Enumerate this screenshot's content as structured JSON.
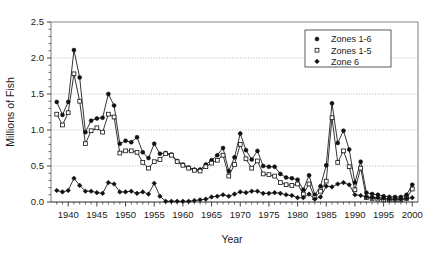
{
  "chart_data": {
    "type": "line",
    "title": "",
    "xlabel": "Year",
    "ylabel": "Millions of Fish",
    "xlim": [
      1937,
      2001
    ],
    "ylim": [
      0.0,
      2.5
    ],
    "grid": true,
    "legend_position": "top-right",
    "y_ticks": [
      "0.0",
      "0.5",
      "1.0",
      "1.5",
      "2.0",
      "2.5"
    ],
    "y_tick_values": [
      0.0,
      0.5,
      1.0,
      1.5,
      2.0,
      2.5
    ],
    "x_ticks": [
      "1940",
      "1945",
      "1950",
      "1955",
      "1960",
      "1965",
      "1970",
      "1975",
      "1980",
      "1985",
      "1990",
      "1995",
      "2000"
    ],
    "x_tick_values": [
      1940,
      1945,
      1950,
      1955,
      1960,
      1965,
      1970,
      1975,
      1980,
      1985,
      1990,
      1995,
      2000
    ],
    "x": [
      1938,
      1939,
      1940,
      1941,
      1942,
      1943,
      1944,
      1945,
      1946,
      1947,
      1948,
      1949,
      1950,
      1951,
      1952,
      1953,
      1954,
      1955,
      1956,
      1957,
      1958,
      1959,
      1960,
      1961,
      1962,
      1963,
      1964,
      1965,
      1966,
      1967,
      1968,
      1969,
      1970,
      1971,
      1972,
      1973,
      1974,
      1975,
      1976,
      1977,
      1978,
      1979,
      1980,
      1981,
      1982,
      1983,
      1984,
      1985,
      1986,
      1987,
      1988,
      1989,
      1990,
      1991,
      1992,
      1993,
      1994,
      1995,
      1996,
      1997,
      1998,
      1999,
      2000
    ],
    "series": [
      {
        "name": "Zones 1-6",
        "marker": "filled-circle",
        "values": [
          1.39,
          1.21,
          1.39,
          2.11,
          1.73,
          0.97,
          1.13,
          1.16,
          1.17,
          1.5,
          1.34,
          0.81,
          0.85,
          0.83,
          0.9,
          0.69,
          0.61,
          0.81,
          0.67,
          0.68,
          0.66,
          0.57,
          0.52,
          0.48,
          0.45,
          0.45,
          0.52,
          0.58,
          0.65,
          0.75,
          0.43,
          0.62,
          0.95,
          0.72,
          0.59,
          0.71,
          0.5,
          0.49,
          0.49,
          0.39,
          0.34,
          0.33,
          0.31,
          0.17,
          0.37,
          0.1,
          0.22,
          0.51,
          1.37,
          0.82,
          0.99,
          0.73,
          0.27,
          0.56,
          0.13,
          0.11,
          0.1,
          0.08,
          0.07,
          0.07,
          0.07,
          0.1,
          0.24
        ]
      },
      {
        "name": "Zones 1-5",
        "marker": "open-square",
        "values": [
          1.22,
          1.07,
          1.24,
          1.78,
          1.4,
          0.81,
          0.99,
          1.03,
          0.97,
          1.22,
          1.18,
          0.68,
          0.71,
          0.71,
          0.69,
          0.55,
          0.47,
          0.56,
          0.59,
          0.67,
          0.65,
          0.56,
          0.51,
          0.47,
          0.44,
          0.43,
          0.49,
          0.54,
          0.58,
          0.65,
          0.36,
          0.52,
          0.8,
          0.6,
          0.47,
          0.57,
          0.39,
          0.38,
          0.36,
          0.27,
          0.24,
          0.23,
          0.25,
          0.11,
          0.25,
          0.06,
          0.15,
          0.29,
          1.17,
          0.55,
          0.71,
          0.49,
          0.17,
          0.47,
          0.06,
          0.05,
          0.04,
          0.03,
          0.03,
          0.03,
          0.03,
          0.05,
          0.18
        ]
      },
      {
        "name": "Zone 6",
        "marker": "filled-diamond",
        "values": [
          0.16,
          0.14,
          0.16,
          0.33,
          0.23,
          0.15,
          0.15,
          0.13,
          0.12,
          0.27,
          0.25,
          0.14,
          0.14,
          0.15,
          0.12,
          0.14,
          0.11,
          0.26,
          0.08,
          0.01,
          0.01,
          0.01,
          0.01,
          0.01,
          0.02,
          0.03,
          0.04,
          0.07,
          0.08,
          0.1,
          0.08,
          0.11,
          0.14,
          0.13,
          0.15,
          0.15,
          0.12,
          0.12,
          0.13,
          0.12,
          0.1,
          0.09,
          0.06,
          0.06,
          0.11,
          0.04,
          0.07,
          0.22,
          0.21,
          0.25,
          0.27,
          0.24,
          0.1,
          0.09,
          0.07,
          0.06,
          0.06,
          0.05,
          0.04,
          0.04,
          0.04,
          0.05,
          0.06
        ]
      }
    ]
  },
  "legend": {
    "entries": [
      {
        "label": "Zones 1-6",
        "marker": "filled-circle"
      },
      {
        "label": "Zones 1-5",
        "marker": "open-square"
      },
      {
        "label": "Zone 6",
        "marker": "filled-diamond"
      }
    ]
  }
}
